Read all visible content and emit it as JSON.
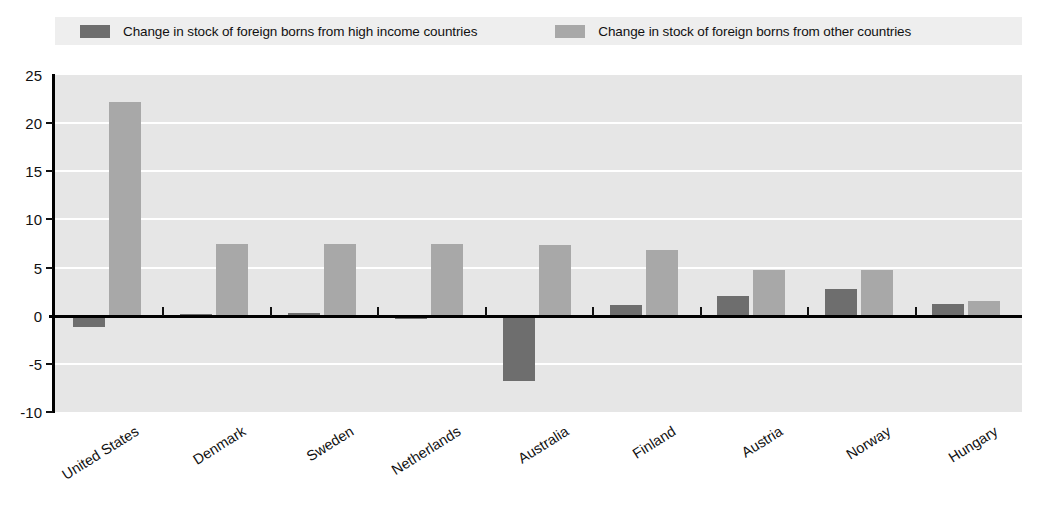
{
  "title_remnant": "",
  "legend": {
    "items": [
      {
        "label": "Change in stock of foreign borns from high income countries",
        "color": "#6e6e6e",
        "swatch_name": "legend-swatch-high-income"
      },
      {
        "label": "Change in stock of foreign borns from other countries",
        "color": "#a8a8a8",
        "swatch_name": "legend-swatch-other"
      }
    ]
  },
  "axis": {
    "y_ticks": [
      "25",
      "20",
      "15",
      "10",
      "5",
      "0",
      "-5",
      "-10"
    ]
  },
  "chart_data": {
    "type": "bar",
    "title": "",
    "subtitle": "",
    "xlabel": "",
    "ylabel": "",
    "ylim": [
      -10,
      25
    ],
    "ytick_values": [
      25,
      20,
      15,
      10,
      5,
      0,
      -5,
      -10
    ],
    "grid": true,
    "legend_position": "top",
    "orientation": "vertical",
    "grouping": "grouped",
    "categories": [
      "United States",
      "Denmark",
      "Sweden",
      "Netherlands",
      "Australia",
      "Finland",
      "Austria",
      "Norway",
      "Hungary"
    ],
    "series": [
      {
        "name": "Change in stock of foreign borns from high income countries",
        "color": "#6e6e6e",
        "values": [
          -1.2,
          0.2,
          0.25,
          -0.3,
          -6.8,
          1.1,
          2.1,
          2.8,
          1.2
        ]
      },
      {
        "name": "Change in stock of foreign borns from other countries",
        "color": "#a8a8a8",
        "values": [
          22.2,
          7.5,
          7.5,
          7.5,
          7.3,
          6.8,
          4.8,
          4.8,
          1.5
        ]
      }
    ]
  },
  "colors": {
    "plot_background": "#e6e6e6",
    "gridline": "#ffffff",
    "axis": "#000000",
    "legend_background": "#eeeeee"
  }
}
